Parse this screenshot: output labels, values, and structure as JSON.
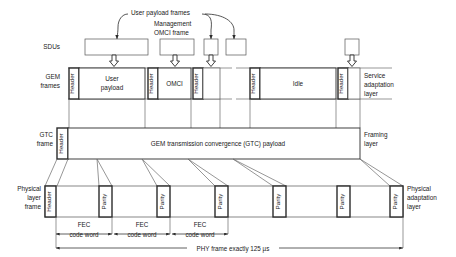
{
  "figure": {
    "colors": {
      "line": "#2b2b2b",
      "thin_line": "#6a6a6a",
      "background": "#ffffff"
    }
  },
  "annotations": {
    "user_payload_frames": "User payload frames",
    "management_line1": "Management",
    "management_line2": "OMCI frame"
  },
  "rows": {
    "sdu": {
      "label": "SDUs",
      "boxes": [
        {
          "name": "sdu-user-payload-large",
          "text": ""
        },
        {
          "name": "sdu-omci",
          "text": ""
        },
        {
          "name": "sdu-small-1",
          "text": ""
        },
        {
          "name": "sdu-small-2",
          "text": ""
        },
        {
          "name": "sdu-right",
          "text": ""
        }
      ]
    },
    "gem": {
      "label_line1": "GEM",
      "label_line2": "frames",
      "right_label_line1": "Service",
      "right_label_line2": "adaptation",
      "right_label_line3": "layer",
      "cells": [
        {
          "name": "gem-header-1",
          "text": "Header",
          "orientation": "vertical"
        },
        {
          "name": "gem-user-payload",
          "text_line1": "User",
          "text_line2": "payload",
          "orientation": "horizontal"
        },
        {
          "name": "gem-header-2",
          "text": "Header",
          "orientation": "vertical"
        },
        {
          "name": "gem-omci",
          "text": "OMCI",
          "orientation": "horizontal"
        },
        {
          "name": "gem-header-3",
          "text": "Header",
          "orientation": "vertical"
        },
        {
          "name": "gem-header-4",
          "text": "Header",
          "orientation": "vertical"
        },
        {
          "name": "gem-idle",
          "text": "Idle",
          "orientation": "horizontal"
        },
        {
          "name": "gem-header-5",
          "text": "Header",
          "orientation": "vertical"
        }
      ]
    },
    "gtc": {
      "label_line1": "GTC",
      "label_line2": "frame",
      "right_label_line1": "Framing",
      "right_label_line2": "layer",
      "header_text": "Header",
      "payload_text": "GEM transmission convergence (GTC) payload"
    },
    "phy": {
      "label_line1": "Physical",
      "label_line2": "layer",
      "label_line3": "frame",
      "right_label_line1": "Physical",
      "right_label_line2": "adaptation",
      "right_label_line3": "layer",
      "header_text": "Header",
      "parity_text": "Parity",
      "parity_count": 6
    }
  },
  "dimensions": {
    "fec_label_line1": "FEC",
    "fec_label_line2": "code word",
    "fec_count": 3,
    "phy_frame_label": "PHY frame exactly 125 µs"
  }
}
